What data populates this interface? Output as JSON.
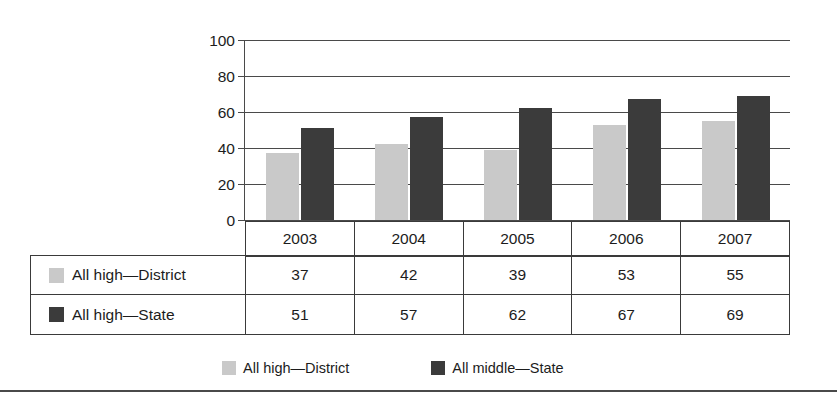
{
  "chart_data": {
    "type": "bar",
    "title": "",
    "xlabel": "",
    "ylabel": "",
    "ylim": [
      0,
      100
    ],
    "ytick_values": [
      100,
      80,
      60,
      40,
      20,
      0
    ],
    "ytick_labels": [
      "100",
      "80",
      "60",
      "40",
      "20",
      "0"
    ],
    "grid": true,
    "legend_position": "bottom",
    "categories": [
      "2003",
      "2004",
      "2005",
      "2006",
      "2007"
    ],
    "series": [
      {
        "name": "All high—District",
        "legend_name": "All high—District",
        "color": "#c9c9c9",
        "values": [
          37,
          42,
          39,
          53,
          55
        ]
      },
      {
        "name": "All high—State",
        "legend_name": "All middle—State",
        "color": "#3b3b3b",
        "values": [
          51,
          57,
          62,
          67,
          69
        ]
      }
    ]
  },
  "table": {
    "header": [
      "2003",
      "2004",
      "2005",
      "2006",
      "2007"
    ],
    "rows": [
      {
        "label": "All high—District",
        "swatch": "light",
        "values": [
          "37",
          "42",
          "39",
          "53",
          "55"
        ]
      },
      {
        "label": "All high—State",
        "swatch": "dark",
        "values": [
          "51",
          "57",
          "62",
          "67",
          "69"
        ]
      }
    ]
  },
  "legend": {
    "items": [
      {
        "label": "All high—District",
        "swatch": "light"
      },
      {
        "label": "All middle—State",
        "swatch": "dark"
      }
    ]
  }
}
